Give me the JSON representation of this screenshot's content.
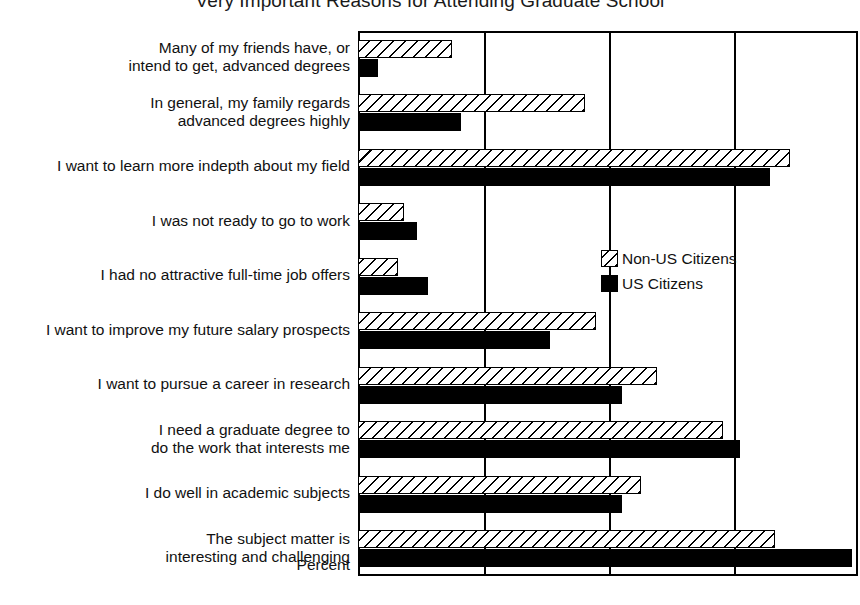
{
  "chart_data": {
    "type": "bar",
    "orientation": "horizontal",
    "title": "Very Important Reasons for Attending Graduate School",
    "xlabel": "Percent",
    "ylabel": "",
    "xlim": [
      0,
      100
    ],
    "xticks": [
      0,
      25,
      50,
      75,
      100
    ],
    "grid": true,
    "legend_position": "center-right",
    "categories": [
      "Many of my friends have, or\nintend to get, advanced degrees",
      "In general, my family regards\nadvanced degrees highly",
      "I want to learn more indepth about my field",
      "I was not ready to go to work",
      "I had no attractive full-time job offers",
      "I want to improve my future salary prospects",
      "I want to pursue a career in research",
      "I need a graduate degree to\ndo the work that interests me",
      "I do well in academic subjects",
      "The subject matter is\ninteresting and challenging"
    ],
    "series": [
      {
        "name": "Non-US Citizens",
        "fill": "hatched",
        "values": [
          18.8,
          45.4,
          86.4,
          9.2,
          8.0,
          47.6,
          59.8,
          73.0,
          56.6,
          83.4
        ]
      },
      {
        "name": "US Citizens",
        "fill": "solid-black",
        "values": [
          4.0,
          20.6,
          82.4,
          11.8,
          14.0,
          38.4,
          52.8,
          76.4,
          52.8,
          98.8
        ]
      }
    ]
  },
  "legend": {
    "items": [
      {
        "label": "Non-US Citizens",
        "fill": "hatched"
      },
      {
        "label": "US Citizens",
        "fill": "solid-black"
      }
    ]
  },
  "colors": {
    "axis": "#000000",
    "bar_us": "#000000",
    "bar_nonus_outline": "#000000",
    "background": "#ffffff"
  }
}
